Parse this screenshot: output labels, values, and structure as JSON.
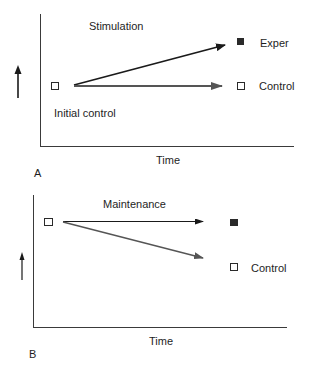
{
  "colors": {
    "axis": "#3a3a3a",
    "experimental_arrow": "#1a1a1a",
    "control_arrow": "#555555",
    "filled_marker": "#2a2a2a",
    "open_marker_stroke": "#2a2a2a",
    "background": "#ffffff"
  },
  "panels": [
    {
      "letter": "A",
      "title": "Stimulation",
      "x_axis_label": "Time",
      "y_axis_indicator": "up-arrow",
      "initial_label": "Initial control",
      "end_labels": {
        "experimental": "Exper",
        "control": "Control"
      },
      "description": "Stimulation raises the experimental group above control; control stays level"
    },
    {
      "letter": "B",
      "title": "Maintenance",
      "x_axis_label": "Time",
      "y_axis_indicator": "up-arrow",
      "initial_label": "",
      "end_labels": {
        "experimental": "",
        "control": "Control"
      },
      "description": "Maintenance keeps the experimental group level while control declines"
    }
  ]
}
